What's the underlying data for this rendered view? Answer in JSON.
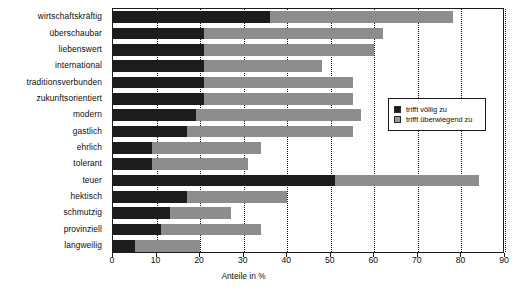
{
  "chart_data": {
    "type": "bar",
    "orientation": "horizontal",
    "stacked": true,
    "title": "",
    "xlabel": "Anteile in %",
    "ylabel": "",
    "xlim": [
      0,
      90
    ],
    "xticks": [
      0,
      10,
      20,
      30,
      40,
      50,
      60,
      70,
      80,
      90
    ],
    "grid": "vertical-dotted",
    "legend_position": "right-inside",
    "categories": [
      "wirtschaftskräftig",
      "überschaubar",
      "liebenswert",
      "international",
      "traditionsverbunden",
      "zukunftsorientiert",
      "modern",
      "gastlich",
      "ehrlich",
      "tolerant",
      "teuer",
      "hektisch",
      "schmutzig",
      "provinziell",
      "langweilig"
    ],
    "series": [
      {
        "name": "trifft völlig zu",
        "color": "#1c1c1c",
        "values": [
          36,
          21,
          21,
          21,
          21,
          21,
          19,
          17,
          9,
          9,
          51,
          17,
          13,
          11,
          5
        ]
      },
      {
        "name": "trifft überwiegend zu",
        "color": "#8d8d8d",
        "values": [
          42,
          41,
          39,
          27,
          34,
          34,
          38,
          38,
          25,
          22,
          33,
          23,
          14,
          23,
          15
        ]
      }
    ],
    "totals": [
      78,
      62,
      60,
      48,
      55,
      55,
      57,
      55,
      34,
      31,
      84,
      40,
      27,
      34,
      20
    ]
  },
  "legend": {
    "items": [
      {
        "label": "trifft völlig zu",
        "swatch": "dark"
      },
      {
        "label": "trifft überwiegend zu",
        "swatch": "light"
      }
    ]
  },
  "axis": {
    "x_title": "Anteile in %"
  }
}
